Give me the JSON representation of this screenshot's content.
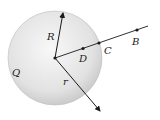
{
  "diagram": {
    "labels": {
      "R": "R",
      "r": "r",
      "Q": "Q",
      "D": "D",
      "C": "C",
      "B": "B"
    },
    "colors": {
      "sphere_fill_center": "#f7f7f7",
      "sphere_fill_edge": "#c8c8c8",
      "stroke": "#1a1a1a"
    }
  }
}
